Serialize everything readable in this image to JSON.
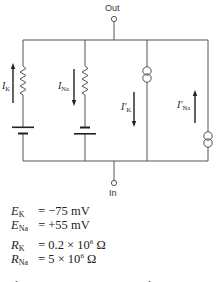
{
  "diagram": {
    "terminals": {
      "out_label": "Out",
      "in_label": "In"
    },
    "branches": [
      {
        "id": "k-resistive",
        "current_label": "I",
        "current_sub": "K",
        "arrow": "up",
        "components": [
          "resistor",
          "battery"
        ]
      },
      {
        "id": "na-resistive",
        "current_label": "I",
        "current_sub": "Na",
        "arrow": "down",
        "components": [
          "resistor",
          "battery-reversed"
        ]
      },
      {
        "id": "k-source",
        "current_label": "I′",
        "current_sub": "K",
        "arrow": "down",
        "components": [
          "current-source"
        ]
      },
      {
        "id": "na-source",
        "current_label": "I′",
        "current_sub": "Na",
        "arrow": "up",
        "components": [
          "current-source"
        ]
      }
    ]
  },
  "equations": {
    "e_k": {
      "sym": "E",
      "sub": "K",
      "eq": "=",
      "value": "−75 mV"
    },
    "e_na": {
      "sym": "E",
      "sub": "Na",
      "eq": "=",
      "value": "+55 mV"
    },
    "r_k": {
      "sym": "R",
      "sub": "K",
      "eq": "=",
      "pre": "0.2 × 10",
      "exp": "6",
      "unit": " Ω"
    },
    "r_na": {
      "sym": "R",
      "sub": "Na",
      "eq": "=",
      "pre": "5 × 10",
      "exp": "6",
      "unit": " Ω"
    }
  },
  "footer_cut_text": "The currents are opposite in direction"
}
